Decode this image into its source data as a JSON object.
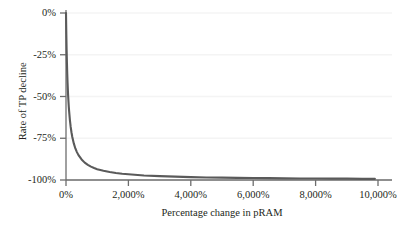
{
  "chart_data": {
    "type": "line",
    "title": "",
    "subtitle": "",
    "xlabel": "Percentage change in pRAM",
    "ylabel": "Rate of TP decline",
    "xlim": [
      0,
      10000
    ],
    "ylim": [
      -100,
      0
    ],
    "grid": true,
    "grid_orientation": "horizontal",
    "legend": null,
    "legend_position": "none",
    "xtick_labels": [
      "0%",
      "2,000%",
      "4,000%",
      "6,000%",
      "8,000%",
      "10,000%"
    ],
    "xtick_values": [
      0,
      2000,
      4000,
      6000,
      8000,
      10000
    ],
    "ytick_labels": [
      "0%",
      "-25%",
      "-50%",
      "-75%",
      "-100%"
    ],
    "ytick_values": [
      0,
      -25,
      -50,
      -75,
      -100
    ],
    "series": [
      {
        "name": "Rate of TP decline",
        "color": "#5a5a5a",
        "line_width": 2.1,
        "description": "Hyperbolic decay: y = -100 * x / (x + k), k approximately 70",
        "x": [
          0,
          10,
          20,
          30,
          40,
          50,
          60,
          70,
          80,
          90,
          100,
          125,
          150,
          175,
          200,
          250,
          300,
          350,
          400,
          500,
          600,
          700,
          800,
          900,
          1000,
          1200,
          1400,
          1600,
          1800,
          2000,
          2500,
          3000,
          3500,
          4000,
          4500,
          5000,
          5500,
          6000,
          6500,
          7000,
          7500,
          8000,
          8500,
          9000,
          9500,
          9900
        ],
        "y": [
          0,
          -12.5,
          -22.2,
          -30.0,
          -36.4,
          -41.7,
          -46.2,
          -50.0,
          -53.3,
          -56.3,
          -58.8,
          -64.1,
          -68.2,
          -71.4,
          -74.1,
          -78.1,
          -81.1,
          -83.3,
          -85.1,
          -87.7,
          -89.6,
          -90.9,
          -92.0,
          -92.8,
          -93.5,
          -94.5,
          -95.2,
          -95.8,
          -96.3,
          -96.6,
          -97.3,
          -97.7,
          -98.0,
          -98.3,
          -98.5,
          -98.6,
          -98.7,
          -98.8,
          -98.9,
          -99.0,
          -99.1,
          -99.1,
          -99.2,
          -99.2,
          -99.3,
          -99.3
        ]
      }
    ],
    "axis_color": "#6d6d6d",
    "grid_color": "#f2f2f2",
    "background": "#ffffff"
  }
}
